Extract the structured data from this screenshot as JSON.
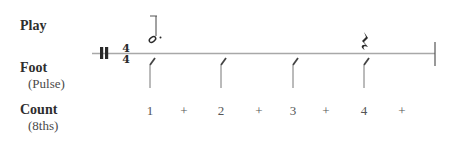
{
  "rows": {
    "play": {
      "label": "Play"
    },
    "foot": {
      "label": "Foot",
      "sublabel": "(Pulse)"
    },
    "count": {
      "label": "Count",
      "sublabel": "(8ths)"
    }
  },
  "time_signature": {
    "top": "4",
    "bottom": "4"
  },
  "notes": [
    {
      "type": "dotted-half-note",
      "beat": 1
    },
    {
      "type": "quarter-rest",
      "beat": 4
    }
  ],
  "foot_taps": [
    1,
    2,
    3,
    4
  ],
  "counts": [
    "1",
    "+",
    "2",
    "+",
    "3",
    "+",
    "4",
    "+"
  ],
  "colors": {
    "staff": "#9a9a9a",
    "ink": "#2a2a2a"
  }
}
